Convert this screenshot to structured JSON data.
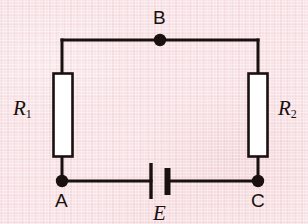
{
  "figure": {
    "kind": "circuit-diagram",
    "background_color": "#f9e3e6",
    "ink_color": "#19100f",
    "component_fill_color": "#ffffff",
    "width": 308,
    "height": 224
  },
  "labels": {
    "node_b": "B",
    "node_a": "A",
    "node_c": "C",
    "resistor_left_symbol": "R",
    "resistor_left_subscript": "1",
    "resistor_right_symbol": "R",
    "resistor_right_subscript": "2",
    "battery": "E"
  },
  "components": [
    {
      "name": "resistor-r1",
      "type": "resistor",
      "label": "R1",
      "orientation": "vertical",
      "box": {
        "x": 53,
        "y": 73,
        "width": 20,
        "height": 84
      }
    },
    {
      "name": "resistor-r2",
      "type": "resistor",
      "label": "R2",
      "orientation": "vertical",
      "box": {
        "x": 248,
        "y": 73,
        "width": 20,
        "height": 84
      }
    },
    {
      "name": "battery-e",
      "type": "battery",
      "label": "E",
      "orientation": "horizontal",
      "long_plate_x": 151,
      "short_plate_x": 167,
      "center_y": 181
    }
  ],
  "nodes": [
    {
      "name": "node-b",
      "label": "B",
      "x": 160,
      "y": 40
    },
    {
      "name": "node-a",
      "label": "A",
      "x": 62,
      "y": 181
    },
    {
      "name": "node-c",
      "label": "C",
      "x": 258,
      "y": 181
    }
  ],
  "wires": {
    "top_y": 40,
    "bottom_y": 181,
    "left_x": 62,
    "right_x": 258,
    "stroke_width": 3
  }
}
